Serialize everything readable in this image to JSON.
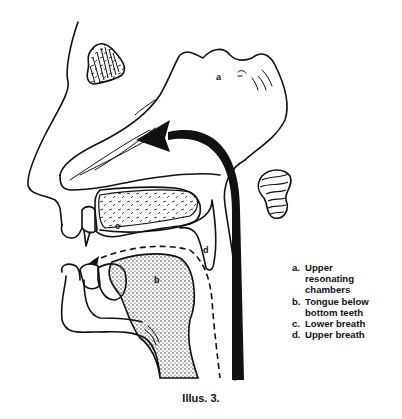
{
  "figure": {
    "caption": "Illus. 3.",
    "labels": {
      "a": "a",
      "b": "b",
      "c": "c",
      "d": "d"
    },
    "legend": [
      {
        "key": "a.",
        "text": "Upper\nresonating\nchambers"
      },
      {
        "key": "b.",
        "text": "Tongue below\nbottom teeth"
      },
      {
        "key": "c.",
        "text": "Lower breath"
      },
      {
        "key": "d.",
        "text": "Upper breath"
      }
    ],
    "colors": {
      "ink": "#111111",
      "background": "#ffffff"
    }
  }
}
